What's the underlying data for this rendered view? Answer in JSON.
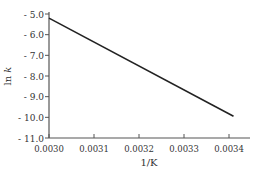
{
  "chart_data": {
    "type": "line",
    "title": "",
    "xlabel": "1/K",
    "ylabel": "ln k",
    "xlim": [
      0.003,
      0.00345
    ],
    "ylim": [
      -11.0,
      -5.0
    ],
    "grid": false,
    "legend": null,
    "x_ticks": [
      "0.0030",
      "0.0031",
      "0.0032",
      "0.0033",
      "0.0034"
    ],
    "y_ticks": [
      "- 5.0",
      "- 6.0",
      "- 7.0",
      "- 8.0",
      "- 9.0",
      "- 10.0",
      "- 11.0"
    ],
    "series": [
      {
        "name": "ln k vs 1/T",
        "x": [
          0.003,
          0.00341
        ],
        "y": [
          -5.2,
          -9.95
        ],
        "color": "#222222"
      }
    ]
  }
}
